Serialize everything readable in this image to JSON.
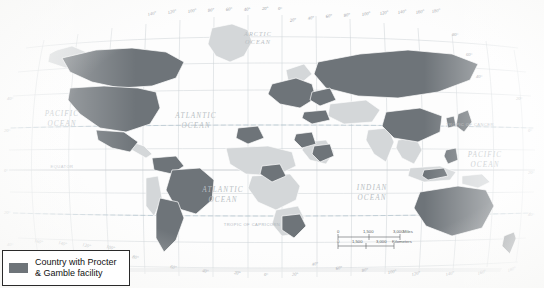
{
  "page": {
    "body_text_lines": [
      "lar tasks. Transnationals de-",
      "in response",
      "labor for",
      "vailing",
      "war",
      "c"
    ]
  },
  "map": {
    "title": "World map of countries with Procter & Gamble facilities",
    "projection": "Robinson",
    "colors": {
      "highlight_country": "#6e7479",
      "other_country": "#d3d6d8",
      "country_border": "#ffffff",
      "graticule": "#c9ced2",
      "tropic_line": "#b9c6cf",
      "ocean": "#fdfdfd",
      "legend_border": "#2a2a2a",
      "label_text": "#b9bfc4"
    },
    "ocean_labels": [
      {
        "name": "ARCTIC OCEAN",
        "lines": [
          "ARCTIC",
          "OCEAN"
        ],
        "x": 258,
        "y": 36,
        "size": 6.2
      },
      {
        "name": "PACIFIC OCEAN (east)",
        "lines": [
          "PACIFIC",
          "OCEAN"
        ],
        "x": 62,
        "y": 116,
        "size": 7.2
      },
      {
        "name": "ATLANTIC OCEAN (north)",
        "lines": [
          "ATLANTIC",
          "OCEAN"
        ],
        "x": 196,
        "y": 118,
        "size": 7.2
      },
      {
        "name": "ATLANTIC OCEAN (south)",
        "lines": [
          "ATLANTIC",
          "OCEAN"
        ],
        "x": 223,
        "y": 192,
        "size": 7.2
      },
      {
        "name": "INDIAN OCEAN",
        "lines": [
          "INDIAN",
          "OCEAN"
        ],
        "x": 372,
        "y": 190,
        "size": 7.2
      },
      {
        "name": "PACIFIC OCEAN (west)",
        "lines": [
          "PACIFIC",
          "OCEAN"
        ],
        "x": 485,
        "y": 157,
        "size": 7.2
      }
    ],
    "reference_lines": [
      {
        "name": "TROPIC OF CANCER",
        "label": "TROPIC OF CANCER",
        "y": 128,
        "label_x": 470
      },
      {
        "name": "EQUATOR",
        "label": "EQUATOR",
        "y": 170,
        "label_x": 62
      },
      {
        "name": "TROPIC OF CAPRICORN",
        "label": "TROPIC OF CAPRICORN",
        "y": 213,
        "label_x": 222
      }
    ],
    "longitude_labels_top": [
      "140°",
      "120°",
      "100°",
      "80°",
      "60°",
      "40°",
      "20°",
      "0°",
      "20°",
      "40°",
      "60°",
      "80°",
      "100°",
      "120°",
      "140°",
      "160°",
      "180°"
    ],
    "longitude_labels_bottom": [
      "160°",
      "140°",
      "120°",
      "100°",
      "80°",
      "60°",
      "40°",
      "20°",
      "0°",
      "20°",
      "40°",
      "60°",
      "80°",
      "100°",
      "120°",
      "140°",
      "160°",
      "180°"
    ],
    "latitude_labels_left": [
      "40°",
      "20°",
      "0°",
      "20°",
      "40°"
    ],
    "latitude_labels_right": [
      "80°",
      "60°",
      "40°",
      "20°",
      "0°",
      "20°",
      "40°"
    ],
    "scale_bar": {
      "name": "map-scale-bar",
      "miles": {
        "ticks": [
          "0",
          "1,500",
          "3,000"
        ],
        "unit": "Miles"
      },
      "kilometers": {
        "ticks": [
          "0",
          "1,500",
          "3,000"
        ],
        "unit": "Kilometers"
      }
    }
  },
  "legend": {
    "swatch_color": "#6e7479",
    "line1": "Country with Procter",
    "line2": "& Gamble facility"
  }
}
